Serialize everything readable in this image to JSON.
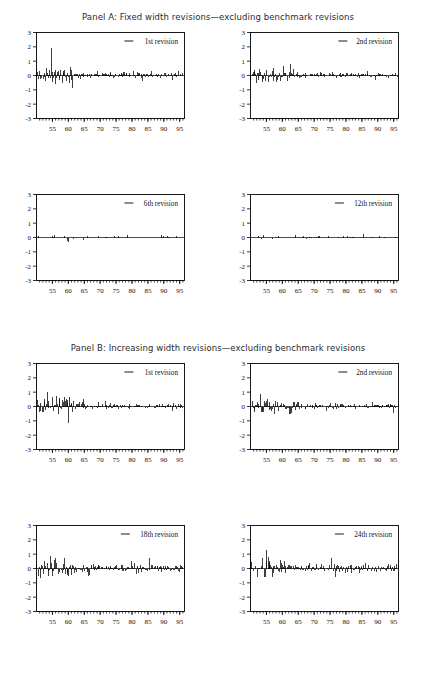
{
  "figure": {
    "width": 436,
    "height": 684,
    "background": "#ffffff",
    "ink": "#000000"
  },
  "panels": [
    {
      "id": "panel-a",
      "title": "Panel A: Fixed width revisions—excluding benchmark revisions",
      "title_y": 10
    },
    {
      "id": "panel-b",
      "title": "Panel B: Increasing width revisions—excluding benchmark revisions",
      "title_y": 341
    }
  ],
  "axes_common": {
    "ylim": [
      -3,
      3
    ],
    "yticks": [
      3,
      2,
      1,
      0,
      -1,
      -2,
      -3
    ],
    "ytick_labels": [
      "3",
      "2",
      "1",
      "0",
      "-1",
      "-2",
      "-3"
    ],
    "xlim": [
      1950.0,
      1996.5
    ],
    "xticks": [
      55,
      60,
      65,
      70,
      75,
      80,
      85,
      90,
      95
    ],
    "xtick_labels": [
      "55",
      "60",
      "65",
      "70",
      "75",
      "80",
      "85",
      "90",
      "95"
    ],
    "minor_tick_spacing_years": 1,
    "grid": false,
    "legend_position": "top-right",
    "series_color": "#000000",
    "xlabel": "",
    "ylabel": ""
  },
  "chart_data": {
    "type": "bar",
    "xlabel": "",
    "ylabel": "",
    "ylim": [
      -3,
      3
    ],
    "xlim": [
      1950,
      1996.5
    ],
    "x_tick_labels": [
      "55",
      "60",
      "65",
      "70",
      "75",
      "80",
      "85",
      "90",
      "95"
    ],
    "y_tick_labels": [
      "3",
      "2",
      "1",
      "0",
      "-1",
      "-2",
      "-3"
    ],
    "grid": false,
    "legend_position": "top-right",
    "note": "Each subplot is a zero-centred vertical spike (bar) series of quarterly revision values plotted from 1950 to 1996. Amplitudes below are described per era because individual quarterly spikes are not separately labelled in the figure.",
    "subplots": [
      {
        "panel": "panel-a",
        "row": 0,
        "col": 0,
        "legend": "1st revision",
        "n_points": 186,
        "seed": 11,
        "density": 1.0,
        "eras": [
          {
            "from": 1950,
            "to": 1962,
            "amplitude": 0.95,
            "max_abs": 1.9
          },
          {
            "from": 1962,
            "to": 1966,
            "amplitude": 0.35,
            "max_abs": 0.8
          },
          {
            "from": 1966,
            "to": 1996.5,
            "amplitude": 0.3,
            "max_abs": 0.75
          }
        ]
      },
      {
        "panel": "panel-a",
        "row": 0,
        "col": 1,
        "legend": "2nd revision",
        "n_points": 186,
        "seed": 23,
        "density": 1.0,
        "eras": [
          {
            "from": 1950,
            "to": 1963,
            "amplitude": 0.85,
            "max_abs": 1.6
          },
          {
            "from": 1963,
            "to": 1966,
            "amplitude": 0.5,
            "max_abs": 1.0
          },
          {
            "from": 1966,
            "to": 1996.5,
            "amplitude": 0.27,
            "max_abs": 0.7
          }
        ]
      },
      {
        "panel": "panel-a",
        "row": 1,
        "col": 0,
        "legend": "6th revision",
        "n_points": 186,
        "seed": 37,
        "density": 0.2,
        "eras": [
          {
            "from": 1950,
            "to": 1962,
            "amplitude": 0.45,
            "max_abs": 0.95
          },
          {
            "from": 1962,
            "to": 1996.5,
            "amplitude": 0.18,
            "max_abs": 0.45
          }
        ]
      },
      {
        "panel": "panel-a",
        "row": 1,
        "col": 1,
        "legend": "12th revision",
        "n_points": 186,
        "seed": 53,
        "density": 0.22,
        "eras": [
          {
            "from": 1950,
            "to": 1958,
            "amplitude": 0.3,
            "max_abs": 0.65
          },
          {
            "from": 1958,
            "to": 1996.5,
            "amplitude": 0.17,
            "max_abs": 0.45
          }
        ]
      },
      {
        "panel": "panel-b",
        "row": 0,
        "col": 0,
        "legend": "1st revision",
        "n_points": 186,
        "seed": 71,
        "density": 1.0,
        "eras": [
          {
            "from": 1950,
            "to": 1962,
            "amplitude": 0.95,
            "max_abs": 2.1
          },
          {
            "from": 1962,
            "to": 1966,
            "amplitude": 0.4,
            "max_abs": 0.9
          },
          {
            "from": 1966,
            "to": 1996.5,
            "amplitude": 0.3,
            "max_abs": 0.8
          }
        ]
      },
      {
        "panel": "panel-b",
        "row": 0,
        "col": 1,
        "legend": "2nd revision",
        "n_points": 186,
        "seed": 89,
        "density": 1.0,
        "eras": [
          {
            "from": 1950,
            "to": 1963,
            "amplitude": 0.95,
            "max_abs": 2.3
          },
          {
            "from": 1963,
            "to": 1966,
            "amplitude": 0.55,
            "max_abs": 1.2
          },
          {
            "from": 1966,
            "to": 1996.5,
            "amplitude": 0.33,
            "max_abs": 0.9
          }
        ]
      },
      {
        "panel": "panel-b",
        "row": 1,
        "col": 0,
        "legend": "18th revision",
        "n_points": 186,
        "seed": 101,
        "density": 1.0,
        "eras": [
          {
            "from": 1950,
            "to": 1962,
            "amplitude": 1.0,
            "max_abs": 2.4
          },
          {
            "from": 1962,
            "to": 1996.5,
            "amplitude": 0.45,
            "max_abs": 1.2
          }
        ]
      },
      {
        "panel": "panel-b",
        "row": 1,
        "col": 1,
        "legend": "24th revision",
        "n_points": 186,
        "seed": 127,
        "density": 1.0,
        "eras": [
          {
            "from": 1950,
            "to": 1962,
            "amplitude": 1.0,
            "max_abs": 2.6
          },
          {
            "from": 1962,
            "to": 1996.5,
            "amplitude": 0.48,
            "max_abs": 1.3
          }
        ]
      }
    ]
  },
  "layout": {
    "subplot_width": 186,
    "subplot_height": 118,
    "plot_left": 32,
    "plot_top": 10,
    "plot_right": 6,
    "plot_bottom": 22,
    "positions": [
      {
        "x": 4,
        "y": 22
      },
      {
        "x": 218,
        "y": 22
      },
      {
        "x": 4,
        "y": 184
      },
      {
        "x": 218,
        "y": 184
      },
      {
        "x": 4,
        "y": 353
      },
      {
        "x": 218,
        "y": 353
      },
      {
        "x": 4,
        "y": 515
      },
      {
        "x": 218,
        "y": 515
      }
    ]
  }
}
